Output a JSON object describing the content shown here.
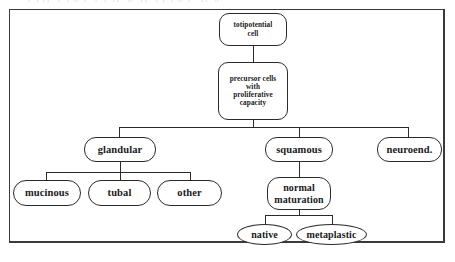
{
  "figure": {
    "type": "tree-diagram",
    "title": "",
    "background_color": "#ffffff",
    "frame_color": "#3a3a3a",
    "node_border_color": "#2b2b2b",
    "text_color": "#1a1a1a",
    "connector_color": "#2b2b2b"
  },
  "nodes": {
    "totipotential": {
      "label": "totipotential\ncell",
      "line1": "totipotential",
      "line2": "cell"
    },
    "precursor": {
      "line1": "precursor cells",
      "line2": "with",
      "line3": "proliferative",
      "line4": "capacity"
    },
    "glandular": {
      "label": "glandular"
    },
    "squamous": {
      "label": "squamous"
    },
    "neuroend": {
      "label": "neuroend."
    },
    "mucinous": {
      "label": "mucinous"
    },
    "tubal": {
      "label": "tubal"
    },
    "other": {
      "label": "other"
    },
    "normal_maturation": {
      "line1": "normal",
      "line2": "maturation"
    },
    "native": {
      "label": "native"
    },
    "metaplastic": {
      "label": "metaplastic"
    }
  },
  "edges": [
    {
      "from": "totipotential",
      "to": "precursor"
    },
    {
      "from": "precursor",
      "to": "glandular"
    },
    {
      "from": "precursor",
      "to": "squamous"
    },
    {
      "from": "precursor",
      "to": "neuroend"
    },
    {
      "from": "glandular",
      "to": "mucinous"
    },
    {
      "from": "glandular",
      "to": "tubal"
    },
    {
      "from": "glandular",
      "to": "other"
    },
    {
      "from": "squamous",
      "to": "normal_maturation"
    },
    {
      "from": "normal_maturation",
      "to": "native"
    },
    {
      "from": "normal_maturation",
      "to": "metaplastic"
    }
  ],
  "caption_remnant": "pqqp  j  pg   p  j   pqp   g   qp  jq   pg  p  qj   g"
}
